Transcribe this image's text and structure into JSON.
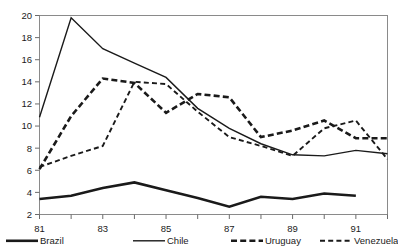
{
  "chart_data": {
    "type": "line",
    "title": "",
    "subtitle": "",
    "xlabel": "",
    "ylabel": "",
    "x": [
      1981,
      1982,
      1983,
      1984,
      1985,
      1986,
      1987,
      1988,
      1989,
      1990,
      1991,
      1992
    ],
    "xtick_labels": [
      "81",
      "83",
      "85",
      "87",
      "89",
      "91"
    ],
    "xtick_values": [
      1981,
      1983,
      1985,
      1987,
      1989,
      1991
    ],
    "ytick_labels": [
      "2",
      "4",
      "6",
      "8",
      "10",
      "12",
      "14",
      "16",
      "18",
      "20"
    ],
    "ytick_values": [
      2,
      4,
      6,
      8,
      10,
      12,
      14,
      16,
      18,
      20
    ],
    "ylim": [
      2,
      20
    ],
    "xlim": [
      1981,
      1992
    ],
    "grid": false,
    "legend_position": "bottom",
    "series": [
      {
        "name": "Brazil",
        "style": "solid-thick",
        "values": [
          3.4,
          3.7,
          4.4,
          4.9,
          4.2,
          3.5,
          2.7,
          3.6,
          3.4,
          3.9,
          3.7,
          null
        ]
      },
      {
        "name": "Chile",
        "style": "solid-thin",
        "values": [
          10.8,
          19.8,
          17.0,
          15.7,
          14.4,
          11.6,
          9.8,
          8.4,
          7.4,
          7.3,
          7.8,
          7.5
        ]
      },
      {
        "name": "Uruguay",
        "style": "dashed-thick",
        "values": [
          6.1,
          10.9,
          14.3,
          13.9,
          11.2,
          12.9,
          12.6,
          9.0,
          9.6,
          10.5,
          8.9,
          8.9
        ]
      },
      {
        "name": "Venezuela",
        "style": "dashed-thin",
        "values": [
          6.3,
          7.3,
          8.2,
          14.0,
          13.8,
          11.3,
          9.0,
          8.2,
          7.3,
          9.8,
          10.5,
          7.0
        ]
      }
    ]
  },
  "legend": {
    "items": [
      {
        "label": "Brazil",
        "swatch": "solid-thick"
      },
      {
        "label": "Chile",
        "swatch": "solid-thin"
      },
      {
        "label": "Uruguay",
        "swatch": "dashed-thick"
      },
      {
        "label": "Venezuela",
        "swatch": "dashed-thin"
      }
    ]
  },
  "colors": {
    "line": "#1a1a1a",
    "axis": "#6b6b6b",
    "frame": "#8a8a8a",
    "background": "#ffffff"
  }
}
